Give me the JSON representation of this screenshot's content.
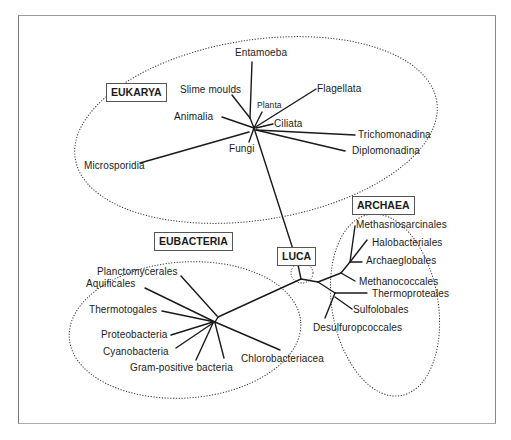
{
  "diagram": {
    "domains": [
      {
        "id": "eukarya",
        "label": "EUKARYA"
      },
      {
        "id": "eubacteria",
        "label": "EUBACTERIA"
      },
      {
        "id": "archaea",
        "label": "ARCHAEA"
      },
      {
        "id": "luca",
        "label": "LUCA"
      }
    ],
    "eukarya": {
      "taxa": [
        "Entamoeba",
        "Slime moulds",
        "Planta",
        "Flagellata",
        "Animalia",
        "Ciliata",
        "Fungi",
        "Trichomonadina",
        "Diplomonadina",
        "Microsporidia"
      ]
    },
    "eubacteria": {
      "taxa": [
        "Planctomycerales",
        "Aquificales",
        "Thermotogales",
        "Proteobacteria",
        "Cyanobacteria",
        "Gram-positive bacteria",
        "Chlorobacteriacea"
      ]
    },
    "archaea": {
      "taxa": [
        "Methasnosarcinales",
        "Halobacteriales",
        "Archaeglobales",
        "Methanococcales",
        "Thermoproteales",
        "Sulfolobales",
        "Desulfuropcoccales"
      ]
    },
    "colors": {
      "line": "#1a1a1a",
      "dotted": "#333333",
      "frame": "#888888",
      "background": "#ffffff"
    }
  }
}
